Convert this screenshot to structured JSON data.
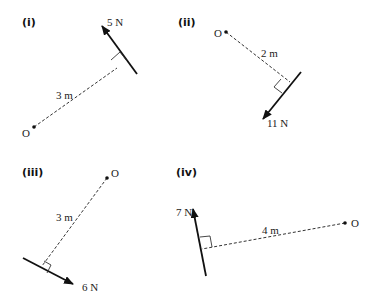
{
  "diagrams": [
    {
      "label": "(i)",
      "force": "5 N",
      "distance": "3 m",
      "point": "O"
    },
    {
      "label": "(ii)",
      "force": "11 N",
      "distance": "2 m",
      "point": "O"
    },
    {
      "label": "(iii)",
      "force": "6 N",
      "distance": "3 m",
      "point": "O"
    },
    {
      "label": "(iv)",
      "force": "7 N",
      "distance": "4 m",
      "point": "O"
    }
  ],
  "colors": {
    "ink": "#111111",
    "background": "#ffffff"
  }
}
